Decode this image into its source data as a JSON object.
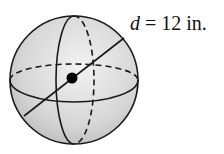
{
  "figure": {
    "shape": "sphere",
    "center_marked": true,
    "label": {
      "variable": "d",
      "equals": " = ",
      "value": "12",
      "unit": " in."
    },
    "colors": {
      "fill": "#d9d9d9",
      "stroke": "#1a1a1a",
      "background": "#ffffff"
    }
  }
}
